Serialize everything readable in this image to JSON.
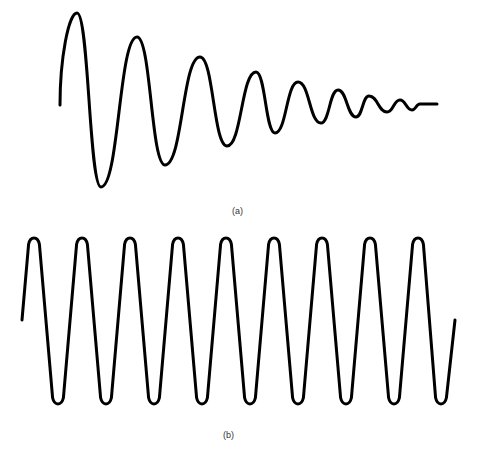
{
  "figure": {
    "panel_a": {
      "label": "(a)",
      "description": "damped oscillation",
      "stroke_color": "#000000",
      "points": [
        [
          60,
          105
        ],
        [
          77,
          13
        ],
        [
          101,
          187
        ],
        [
          137,
          37
        ],
        [
          165,
          165
        ],
        [
          200,
          57
        ],
        [
          227,
          146
        ],
        [
          256,
          72
        ],
        [
          275,
          133
        ],
        [
          298,
          82
        ],
        [
          321,
          123
        ],
        [
          338,
          90
        ],
        [
          356,
          117
        ],
        [
          369,
          96
        ],
        [
          387,
          112
        ],
        [
          400,
          100
        ],
        [
          412,
          110
        ],
        [
          420,
          104
        ],
        [
          437,
          104
        ]
      ]
    },
    "panel_b": {
      "label": "(b)",
      "description": "undamped oscillation",
      "stroke_color": "#000000",
      "start": [
        22,
        320
      ],
      "end": [
        455,
        320
      ],
      "peaks_x": [
        34,
        82,
        130,
        178,
        226,
        274,
        322,
        370,
        418
      ],
      "troughs_x": [
        58,
        106,
        154,
        202,
        250,
        298,
        346,
        394,
        441
      ],
      "peak_y": 237,
      "trough_y": 405
    }
  }
}
